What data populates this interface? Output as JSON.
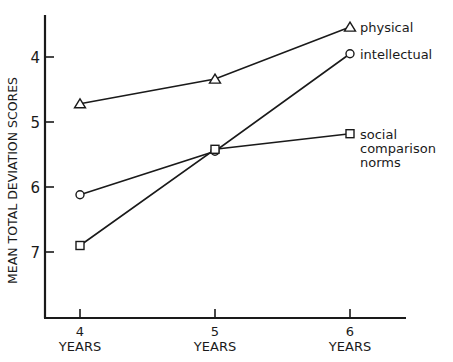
{
  "chart_data": {
    "type": "line",
    "title": "",
    "xlabel": "",
    "ylabel": "MEAN TOTAL DEVIATION SCORES",
    "y_inverted": true,
    "ylim": [
      3.35,
      7.95
    ],
    "yticks": [
      4,
      5,
      6,
      7
    ],
    "categories": [
      "4",
      "5",
      "6"
    ],
    "category_sublabel": "YEARS",
    "grid": false,
    "legend_position": "inline-right",
    "series": [
      {
        "name": "physical",
        "marker": "triangle",
        "values": [
          4.72,
          4.34,
          3.54
        ]
      },
      {
        "name": "intellectual",
        "marker": "circle",
        "values": [
          6.12,
          5.45,
          3.95
        ]
      },
      {
        "name": "social comparison norms",
        "label_lines": [
          "social",
          "comparison",
          "norms"
        ],
        "marker": "square",
        "values": [
          6.9,
          5.42,
          5.18
        ]
      }
    ]
  },
  "colors": {
    "ink": "#1a1a1a",
    "background": "#ffffff"
  }
}
